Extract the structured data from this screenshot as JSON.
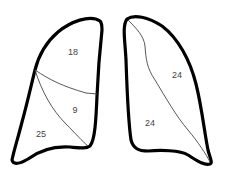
{
  "diagram": {
    "type": "lung lobes",
    "colors": {
      "outline": "#000000",
      "fissure": "#444444",
      "label": "#444444",
      "background": "#ffffff"
    },
    "left_lung": {
      "regions": [
        {
          "name": "upper",
          "label": "18",
          "x": 73,
          "y": 52
        },
        {
          "name": "middle",
          "label": "9",
          "x": 75,
          "y": 110
        },
        {
          "name": "lower",
          "label": "25",
          "x": 41,
          "y": 134
        }
      ]
    },
    "right_lung": {
      "regions": [
        {
          "name": "upper",
          "label": "24",
          "x": 177,
          "y": 75
        },
        {
          "name": "lower",
          "label": "24",
          "x": 150,
          "y": 123
        }
      ]
    }
  }
}
